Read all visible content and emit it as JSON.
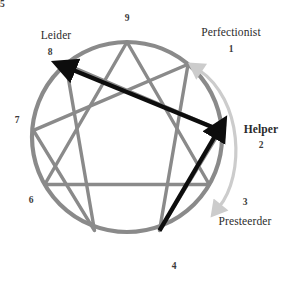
{
  "figure": {
    "colors": {
      "circle": "#8a8a8a",
      "inner_lines": "#8a8a8a",
      "black_arrow": "#0d0d0d",
      "gray_arrow": "#c9c9c9",
      "text": "#2b2b2b"
    },
    "geometry": {
      "center_x": 127,
      "center_y": 137,
      "radius": 95,
      "circle_stroke_width": 4.2,
      "inner_stroke_width": 3.4
    }
  },
  "points": [
    {
      "id": "p9",
      "number": "9",
      "name": "",
      "angle_deg": 0,
      "name_visible": false
    },
    {
      "id": "p1",
      "number": "1",
      "name": "Perfectionist",
      "angle_deg": 40,
      "name_visible": true
    },
    {
      "id": "p2",
      "number": "2",
      "name": "Helper",
      "angle_deg": 80,
      "name_visible": true,
      "bold": true
    },
    {
      "id": "p3",
      "number": "3",
      "name": "Presteerder",
      "angle_deg": 120,
      "name_visible": true
    },
    {
      "id": "p4",
      "number": "4",
      "name": "",
      "angle_deg": 160,
      "name_visible": false
    },
    {
      "id": "p5",
      "number": "5",
      "name": "",
      "angle_deg": 200,
      "name_visible": false
    },
    {
      "id": "p6",
      "number": "6",
      "name": "",
      "angle_deg": 240,
      "name_visible": false
    },
    {
      "id": "p7",
      "number": "7",
      "name": "",
      "angle_deg": 280,
      "name_visible": false
    },
    {
      "id": "p8",
      "number": "8",
      "name": "Leider",
      "angle_deg": 320,
      "name_visible": true
    }
  ],
  "labels": {
    "p9_number": "9",
    "p1_name": "Perfectionist",
    "p1_number": "1",
    "p2_name": "Helper",
    "p2_number": "2",
    "p3_name": "Presteerder",
    "p3_number": "3",
    "p4_number": "4",
    "p5_number": "5",
    "p6_number": "6",
    "p7_number": "7",
    "p8_name": "Leider",
    "p8_number": "8"
  },
  "inner_shapes": {
    "triangle": [
      "9",
      "3",
      "6"
    ],
    "hexad": [
      "1",
      "4",
      "2",
      "8",
      "5",
      "7"
    ]
  },
  "black_arrows": [
    {
      "id": "arrow-4-to-2",
      "from": "4",
      "to": "2",
      "arrowhead_at": "2"
    },
    {
      "id": "arrow-2-to-8",
      "from": "2",
      "to": "8",
      "arrowhead_at": "8"
    }
  ],
  "gray_arrow": {
    "id": "curved-arrow-1-3",
    "from": "1",
    "to": "3",
    "double_headed": true,
    "side": "outside-right"
  }
}
